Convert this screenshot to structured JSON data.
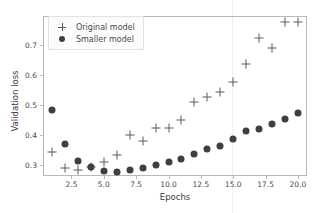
{
  "chart_data": {
    "type": "scatter",
    "title": "",
    "xlabel": "Epochs",
    "ylabel": "Validation loss",
    "xlim": [
      0.3,
      20.7
    ],
    "ylim": [
      0.262,
      0.799
    ],
    "xticks": [
      "2.5",
      "5.0",
      "7.5",
      "10.0",
      "12.5",
      "15.0",
      "17.5",
      "20.0"
    ],
    "xtick_values": [
      2.5,
      5.0,
      7.5,
      10.0,
      12.5,
      15.0,
      17.5,
      20.0
    ],
    "yticks": [
      "0.3",
      "0.4",
      "0.5",
      "0.6",
      "0.7"
    ],
    "ytick_values": [
      0.3,
      0.4,
      0.5,
      0.6,
      0.7
    ],
    "grid": false,
    "legend_position": "upper left",
    "x": [
      1,
      2,
      3,
      4,
      5,
      6,
      7,
      8,
      9,
      10,
      11,
      12,
      13,
      14,
      15,
      16,
      17,
      18,
      19,
      20
    ],
    "series": [
      {
        "name": "Original model",
        "marker": "plus",
        "color": "#5a5a5a",
        "values": [
          0.344,
          0.288,
          0.282,
          0.291,
          0.309,
          0.333,
          0.398,
          0.378,
          0.423,
          0.424,
          0.449,
          0.511,
          0.527,
          0.543,
          0.577,
          0.637,
          0.725,
          0.693,
          0.778,
          0.778
        ]
      },
      {
        "name": "Smaller model",
        "marker": "dot",
        "color": "#3f3f3f",
        "values": [
          0.482,
          0.37,
          0.313,
          0.291,
          0.28,
          0.276,
          0.282,
          0.29,
          0.298,
          0.309,
          0.32,
          0.337,
          0.352,
          0.363,
          0.385,
          0.413,
          0.42,
          0.437,
          0.452,
          0.473
        ]
      }
    ]
  },
  "legend": {
    "items": [
      {
        "label": "Original model",
        "marker": "plus-marker"
      },
      {
        "label": "Smaller model",
        "marker": "dot-marker"
      }
    ]
  },
  "axis": {
    "x_label": "Epochs",
    "y_label": "Validation loss"
  }
}
